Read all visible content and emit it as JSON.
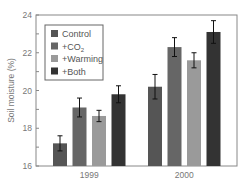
{
  "chart_data": {
    "type": "bar",
    "title": "",
    "xlabel": "",
    "ylabel": "Soil moisture (%)",
    "ylim": [
      16,
      24
    ],
    "yticks": [
      16,
      18,
      20,
      22,
      24
    ],
    "categories": [
      "1999",
      "2000"
    ],
    "grid": false,
    "legend_position": "upper left",
    "series": [
      {
        "name": "Control",
        "color": "#555555",
        "values": [
          17.2,
          20.2
        ],
        "error": [
          0.4,
          0.65
        ]
      },
      {
        "name": "+CO2",
        "color": "#666666",
        "values": [
          19.1,
          22.3
        ],
        "error": [
          0.5,
          0.5
        ]
      },
      {
        "name": "+Warming",
        "color": "#9a9a9a",
        "values": [
          18.65,
          21.6
        ],
        "error": [
          0.3,
          0.4
        ]
      },
      {
        "name": "+Both",
        "color": "#333333",
        "values": [
          19.8,
          23.1
        ],
        "error": [
          0.45,
          0.6
        ]
      }
    ]
  },
  "legend": {
    "items": [
      {
        "label": "Control"
      },
      {
        "label": "+CO",
        "sub": "2"
      },
      {
        "label": "+Warming"
      },
      {
        "label": "+Both"
      }
    ]
  }
}
